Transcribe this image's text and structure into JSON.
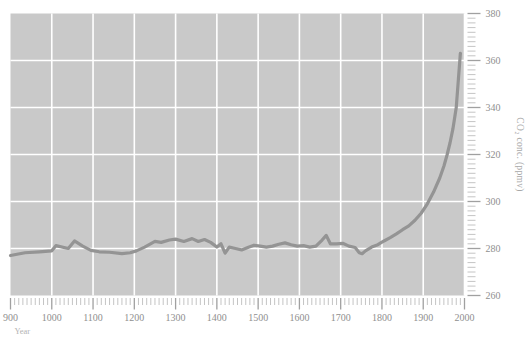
{
  "chart_data": {
    "type": "line",
    "title": "",
    "xlabel": "Year",
    "ylabel": "CO2 conc. (ppmv)",
    "ylabel_display": "CO₂ conc. (ppmv)",
    "xlim": [
      900,
      2000
    ],
    "ylim": [
      260,
      380
    ],
    "xticks": [
      900,
      1000,
      1100,
      1200,
      1300,
      1400,
      1500,
      1600,
      1700,
      1800,
      1900,
      2000
    ],
    "xtick_labels": [
      "900",
      "1000",
      "1100",
      "1200",
      "1300",
      "1400",
      "1500",
      "1600",
      "1700",
      "1800",
      "1900",
      "2000"
    ],
    "yticks": [
      260,
      280,
      300,
      320,
      340,
      360,
      380
    ],
    "ytick_labels": [
      "260",
      "280",
      "300",
      "320",
      "340",
      "360",
      "380"
    ],
    "x_minor_tick_interval": 10,
    "y_minor_tick_interval": 2,
    "grid": true,
    "grid_color": "#ffffff",
    "plot_background": "#c9c9c9",
    "line_color": "#949494",
    "line_width": 3.2,
    "legend": null,
    "series": [
      {
        "name": "Atmospheric CO2 concentration",
        "x": [
          900,
          935,
          970,
          1000,
          1010,
          1040,
          1055,
          1075,
          1095,
          1115,
          1140,
          1170,
          1190,
          1205,
          1225,
          1250,
          1265,
          1285,
          1300,
          1320,
          1340,
          1355,
          1370,
          1385,
          1400,
          1410,
          1420,
          1430,
          1445,
          1460,
          1475,
          1490,
          1505,
          1520,
          1535,
          1550,
          1565,
          1580,
          1595,
          1610,
          1625,
          1640,
          1655,
          1665,
          1675,
          1690,
          1705,
          1720,
          1735,
          1745,
          1752,
          1760,
          1775,
          1790,
          1805,
          1820,
          1835,
          1850,
          1865,
          1880,
          1895,
          1910,
          1925,
          1940,
          1950,
          1958,
          1965,
          1972,
          1980,
          1990
        ],
        "y": [
          277.0,
          278.2,
          278.6,
          279.0,
          281.2,
          280.0,
          283.2,
          281.0,
          279.2,
          278.6,
          278.4,
          277.8,
          278.2,
          279.0,
          280.6,
          283.0,
          282.6,
          283.6,
          284.0,
          283.0,
          284.2,
          283.0,
          283.8,
          282.6,
          280.6,
          282.0,
          278.0,
          280.6,
          280.0,
          279.4,
          280.4,
          281.4,
          281.0,
          280.6,
          281.0,
          281.8,
          282.4,
          281.6,
          281.0,
          281.2,
          280.6,
          281.0,
          283.6,
          285.6,
          282.0,
          282.0,
          282.2,
          281.0,
          280.4,
          278.2,
          277.8,
          279.0,
          280.6,
          281.6,
          283.2,
          284.6,
          286.2,
          288.0,
          289.6,
          292.0,
          295.0,
          299.0,
          304.0,
          310.0,
          315.0,
          320.0,
          325.0,
          331.0,
          340.0,
          363.0
        ]
      }
    ]
  },
  "labels": {
    "x_axis_name": "Year",
    "y_axis_name": "CO₂ conc. (ppmv)"
  }
}
